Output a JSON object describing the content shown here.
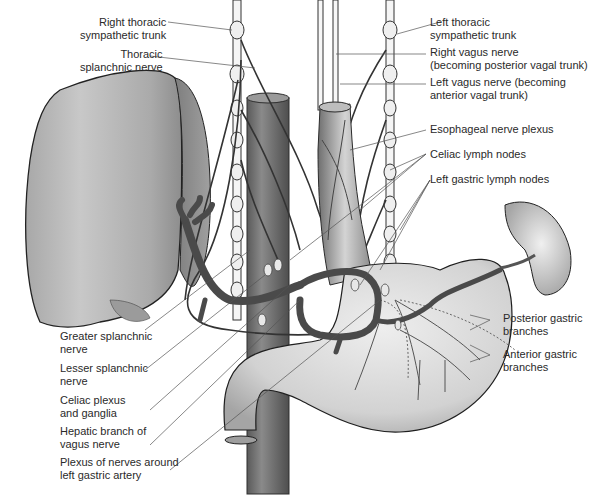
{
  "figure": {
    "type": "anatomical illustration",
    "colors": {
      "background": "#ffffff",
      "organ_fill": "#c9c9c9",
      "organ_shadow": "#8e8e8e",
      "vessel_fill": "#7d7d7d",
      "nerve_stroke": "#3a3a3a",
      "label_text": "#2a2a2a",
      "leader_line": "#555555"
    }
  },
  "labels": {
    "right_thoracic_sympathetic_trunk": {
      "line1": "Right thoracic",
      "line2": "sympathetic trunk"
    },
    "thoracic_splanchnic_nerve": {
      "line1": "Thoracic",
      "line2": "splanchnic nerve"
    },
    "left_thoracic_sympathetic_trunk": {
      "line1": "Left thoracic",
      "line2": "sympathetic trunk"
    },
    "right_vagus_nerve": {
      "line1": "Right vagus nerve",
      "line2": "(becoming posterior vagal trunk)"
    },
    "left_vagus_nerve": {
      "line1": "Left vagus nerve (becoming",
      "line2": "anterior vagal trunk)"
    },
    "esophageal_nerve_plexus": {
      "line1": "Esophageal nerve plexus"
    },
    "celiac_lymph_nodes": {
      "line1": "Celiac lymph nodes"
    },
    "left_gastric_lymph_nodes": {
      "line1": "Left gastric lymph nodes"
    },
    "posterior_gastric_branches": {
      "line1": "Posterior gastric",
      "line2": "branches"
    },
    "anterior_gastric_branches": {
      "line1": "Anterior gastric",
      "line2": "branches"
    },
    "greater_splanchnic_nerve": {
      "line1": "Greater splanchnic",
      "line2": "nerve"
    },
    "lesser_splanchnic_nerve": {
      "line1": "Lesser splanchnic",
      "line2": "nerve"
    },
    "celiac_plexus": {
      "line1": "Celiac plexus",
      "line2": "and ganglia"
    },
    "hepatic_branch": {
      "line1": "Hepatic branch of",
      "line2": "vagus nerve"
    },
    "plexus_left_gastric": {
      "line1": "Plexus of nerves around",
      "line2": "left gastric artery"
    }
  },
  "structures": [
    "liver",
    "aorta",
    "esophagus",
    "stomach",
    "duodenum",
    "spleen",
    "celiac trunk",
    "sympathetic trunks",
    "vagus nerves"
  ]
}
